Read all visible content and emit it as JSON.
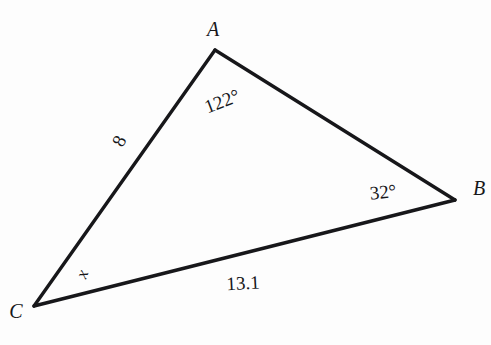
{
  "figure": {
    "kind": "triangle-diagram",
    "background_color": "#fdfdfd",
    "stroke_color": "#17171a",
    "text_color": "#17171a",
    "stroke_width": 3,
    "width": 491,
    "height": 345
  },
  "vertices": [
    {
      "name": "A",
      "label": "A",
      "x": 215,
      "y": 50
    },
    {
      "name": "B",
      "label": "B",
      "x": 455,
      "y": 200
    },
    {
      "name": "C",
      "label": "C",
      "x": 34,
      "y": 306
    }
  ],
  "sides": [
    {
      "name": "AB",
      "from": "A",
      "to": "B",
      "label": ""
    },
    {
      "name": "CA",
      "from": "C",
      "to": "A",
      "label": "8"
    },
    {
      "name": "CB",
      "from": "C",
      "to": "B",
      "label": "13.1"
    }
  ],
  "angles": [
    {
      "at": "A",
      "label": "122°",
      "value": 122,
      "unit": "degrees"
    },
    {
      "at": "B",
      "label": "32°",
      "value": 32,
      "unit": "degrees"
    },
    {
      "at": "C",
      "label": "x",
      "value": null,
      "unit": "degrees"
    }
  ],
  "labels": {
    "vertex_a": "A",
    "vertex_b": "B",
    "vertex_c": "C",
    "angle_a": "122°",
    "angle_b": "32°",
    "angle_c": "x",
    "side_ca": "8",
    "side_cb": "13.1"
  }
}
